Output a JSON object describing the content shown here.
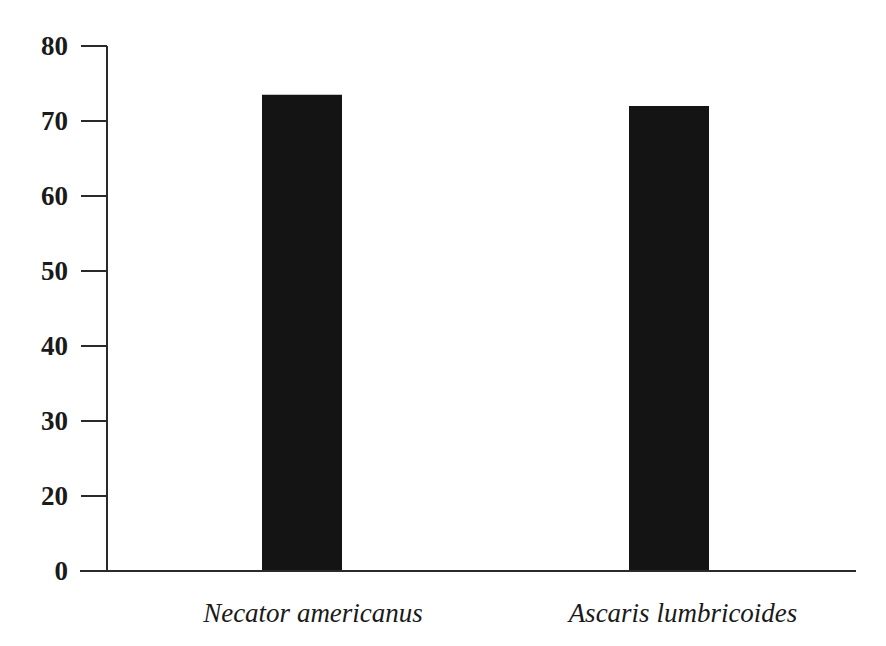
{
  "chart_data": {
    "type": "bar",
    "title": "",
    "xlabel": "",
    "ylabel": "",
    "categories": [
      "Necator americanus",
      "Ascaris lumbricoides"
    ],
    "values": [
      73.5,
      72
    ],
    "ylim": [
      0,
      80
    ],
    "y_ticks": [
      0,
      20,
      30,
      40,
      50,
      60,
      70,
      80
    ],
    "y_tick_note": "ticks equally spaced; no 10 tick (axis break between 0 and 20)",
    "grid": false,
    "legend": null,
    "bar_color": "#141414",
    "category_label_style": "italic"
  }
}
